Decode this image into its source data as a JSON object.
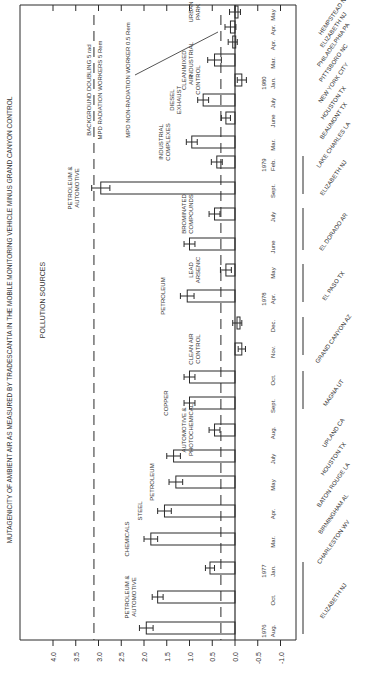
{
  "chart_data": {
    "type": "bar",
    "orientation": "rotated-90-horizontal-bars",
    "title": "MUTAGENICITY OF AMBIENT AIR AS MEASURED BY TRADESCANTIA IN THE MOBILE MONITORING VEHICLE MINUS GRAND CANYON CONTROL",
    "title_underlined_word": "TRADESCANTIA",
    "section_label": "POLLUTION SOURCES",
    "xlabel": "",
    "ylabel": "",
    "ylim": [
      -1.0,
      4.0
    ],
    "ticks": [
      "4.0",
      "3.5",
      "3.0",
      "2.5",
      "2.0",
      "1.5",
      "1.0",
      "0.5",
      "0.0",
      "-0.5",
      "-1.0"
    ],
    "tick_values": [
      4.0,
      3.5,
      3.0,
      2.5,
      2.0,
      1.5,
      1.0,
      0.5,
      0.0,
      -0.5,
      -1.0
    ],
    "reference_lines": [
      {
        "value": 3.1,
        "label_top": "BACKGROUND DOUBLING 5 rad",
        "label_bottom": "MPD RADIATION WORKERS 5 Rem",
        "style": "dashed"
      },
      {
        "value": 0.31,
        "label": "MPD NON-RADIATION WORKER 0.5 Rem",
        "style": "dashed"
      }
    ],
    "categories": [
      "1976 Aug.",
      "Oct.",
      "1977 Jan.",
      "Mar.",
      "Apr.",
      "May",
      "July",
      "Aug.",
      "Sept.",
      "Oct.",
      "Nov.",
      "Dec.",
      "1978 Apr.",
      "May",
      "June",
      "July",
      "Sept.",
      "1979 Feb.",
      "Mar.",
      "June",
      "July",
      "1980 Jan.",
      "Mar.",
      "Apr.",
      "Apr.",
      "May"
    ],
    "values": [
      1.95,
      1.7,
      0.55,
      1.85,
      1.55,
      1.3,
      1.35,
      0.45,
      1.0,
      1.0,
      -0.15,
      -0.05,
      1.05,
      0.2,
      1.0,
      0.45,
      2.95,
      0.4,
      0.95,
      0.2,
      0.7,
      -0.15,
      0.45,
      0.05,
      0.1,
      0.0
    ],
    "errors": [
      0.15,
      0.12,
      0.1,
      0.15,
      0.15,
      0.15,
      0.15,
      0.12,
      0.12,
      0.12,
      0.08,
      0.1,
      0.15,
      0.12,
      0.12,
      0.12,
      0.2,
      0.12,
      0.12,
      0.1,
      0.12,
      0.1,
      0.15,
      0.1,
      0.12,
      0.12
    ],
    "locations": [
      {
        "label": "ELIZABETH NJ",
        "span": [
          0,
          2
        ]
      },
      {
        "label": "CHARLESTON WV",
        "span": [
          3,
          3
        ]
      },
      {
        "label": "BIRMINGHAM AL",
        "span": [
          4,
          4
        ]
      },
      {
        "label": "BATON ROUGE LA",
        "span": [
          5,
          5
        ]
      },
      {
        "label": "HOUSTON TX",
        "span": [
          6,
          6
        ]
      },
      {
        "label": "UPLAND CA",
        "span": [
          7,
          7
        ]
      },
      {
        "label": "MAGNA UT",
        "span": [
          8,
          9
        ]
      },
      {
        "label": "GRAND CANYON AZ",
        "span": [
          10,
          11
        ]
      },
      {
        "label": "EL PASO TX",
        "span": [
          12,
          13
        ]
      },
      {
        "label": "EL DORADO AR",
        "span": [
          14,
          15
        ]
      },
      {
        "label": "ELIZABETH NJ",
        "span": [
          16,
          17
        ]
      },
      {
        "label": "LAKE CHARLES LA",
        "span": [
          18,
          18
        ]
      },
      {
        "label": "BEAUMONT TX",
        "span": [
          19,
          19
        ]
      },
      {
        "label": "HOUSTON TX",
        "span": [
          20,
          20
        ]
      },
      {
        "label": "NEW YORK CITY",
        "span": [
          21,
          21
        ]
      },
      {
        "label": "PITTSBORO NC",
        "span": [
          22,
          22
        ]
      },
      {
        "label": "PHILADELPHIA PA",
        "span": [
          23,
          23
        ]
      },
      {
        "label": "ELIZABETH NJ",
        "span": [
          24,
          24
        ]
      },
      {
        "label": "HEMPSTEAD NY",
        "span": [
          25,
          25
        ]
      }
    ],
    "annotations": [
      {
        "text": [
          "PETROLEUM &",
          "AUTOMOTIVE"
        ],
        "near": 1
      },
      {
        "text": [
          "CHEMICALS"
        ],
        "near": 3
      },
      {
        "text": [
          "STEEL"
        ],
        "near": 4
      },
      {
        "text": [
          "PETROLEUM"
        ],
        "near": 5
      },
      {
        "text": [
          "AUTOMOTIVE &",
          "PHOTOCHEMICAL"
        ],
        "near": 7
      },
      {
        "text": [
          "COPPER"
        ],
        "near": 8
      },
      {
        "text": [
          "CLEAN AIR",
          "CONTROL"
        ],
        "near": 10
      },
      {
        "text": [
          "PETROLEUM"
        ],
        "near": 12
      },
      {
        "text": [
          "LEAD",
          "ARSENIC"
        ],
        "near": 13
      },
      {
        "text": [
          "BROMINATED",
          "COMPOUNDS"
        ],
        "near": 15
      },
      {
        "text": [
          "PETROLEUM &",
          "AUTOMOTIVE"
        ],
        "near": 16
      },
      {
        "text": [
          "INDUSTRIAL",
          "COMPLEXES"
        ],
        "near": 18
      },
      {
        "text": [
          "DIESEL",
          "EXHAUST"
        ],
        "near": 20
      },
      {
        "text": [
          "CLEAN",
          "AIR",
          "CONTROL"
        ],
        "near": 21
      },
      {
        "text": [
          "MIXED",
          "INDUSTRIAL"
        ],
        "near": 22
      },
      {
        "text": [
          "URBAN",
          "PARK"
        ],
        "near": 25
      }
    ],
    "grid": false,
    "legend": null
  },
  "layout": {
    "zero_x": 235,
    "px_per_unit": 45.5,
    "bar_y": [
      630,
      597,
      568,
      538,
      508,
      478,
      452,
      426,
      400,
      370,
      344,
      316,
      285,
      258,
      230,
      196,
      170,
      140,
      112,
      82,
      60,
      40,
      20,
      10,
      0,
      0
    ],
    "ink_color": "#2a2a2a"
  }
}
